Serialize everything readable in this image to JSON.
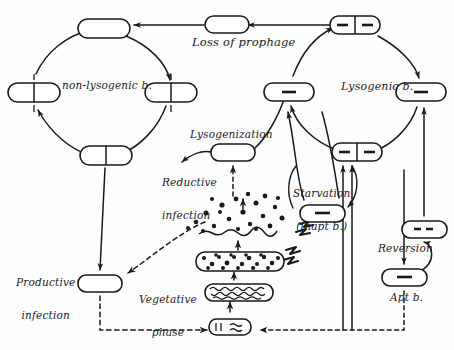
{
  "figure": {
    "ink_color": "#1a1a1a",
    "background_color": "#fefefe",
    "width": 454,
    "height": 350
  },
  "labels": {
    "loss_of_prophage": "Loss of prophage",
    "non_lysogenic": "non-lysogenic b.",
    "lysogenic": "Lysogenic b.",
    "lysogenization": "Lysogenization",
    "reductive_infection_line1": "Reductive",
    "reductive_infection_line2": "infection",
    "productive_infection_line1": "Productive",
    "productive_infection_line2": "infection",
    "vegetative_phase_line1": "Vegetative",
    "vegetative_phase_line2": "phase",
    "starvation_line1": "Starvation",
    "starvation_line2": "(inapt b.)",
    "reversion": "Reversion",
    "apt_bacteria": "Apt b."
  },
  "cycles": [
    {
      "name": "non-lysogenic-cycle",
      "center": [
        108,
        92
      ],
      "radius": 62,
      "cells": [
        {
          "id": "nl-top",
          "pos": [
            108,
            30
          ],
          "type": "empty-cell",
          "prophage_count": 0,
          "dividing": false
        },
        {
          "id": "nl-right",
          "pos": [
            170,
            92
          ],
          "type": "empty-cell-dividing",
          "prophage_count": 0,
          "dividing": true
        },
        {
          "id": "nl-bottom",
          "pos": [
            108,
            155
          ],
          "type": "empty-cell-dividing",
          "prophage_count": 0,
          "dividing": true
        },
        {
          "id": "nl-left",
          "pos": [
            33,
            92
          ],
          "type": "empty-cell-dividing",
          "prophage_count": 0,
          "dividing": true
        }
      ]
    },
    {
      "name": "lysogenic-cycle",
      "center": [
        355,
        92
      ],
      "radius": 62,
      "cells": [
        {
          "id": "ly-top",
          "pos": [
            355,
            25
          ],
          "type": "prophage-cell-dividing",
          "prophage_count": 2,
          "dividing": true
        },
        {
          "id": "ly-right",
          "pos": [
            420,
            92
          ],
          "type": "prophage-cell",
          "prophage_count": 1,
          "dividing": false
        },
        {
          "id": "ly-bottom",
          "pos": [
            357,
            152
          ],
          "type": "prophage-cell-dividing",
          "prophage_count": 2,
          "dividing": true
        },
        {
          "id": "ly-left",
          "pos": [
            288,
            92
          ],
          "type": "prophage-cell",
          "prophage_count": 1,
          "dividing": false
        }
      ]
    }
  ],
  "nodes": [
    {
      "id": "loss-node",
      "pos": [
        225,
        25
      ],
      "type": "empty-cell",
      "prophage_count": 0
    },
    {
      "id": "lysogenization-node",
      "pos": [
        233,
        152
      ],
      "type": "empty-cell",
      "prophage_count": 0
    },
    {
      "id": "productive-node",
      "pos": [
        100,
        283
      ],
      "type": "empty-cell",
      "prophage_count": 0
    },
    {
      "id": "starvation-node",
      "pos": [
        322,
        213
      ],
      "type": "prophage-cell",
      "prophage_count": 1
    },
    {
      "id": "apt-node",
      "pos": [
        404,
        277
      ],
      "type": "prophage-cell",
      "prophage_count": 1
    },
    {
      "id": "reversion-node",
      "pos": [
        424,
        229
      ],
      "type": "prophage-cell",
      "prophage_count": 2
    },
    {
      "id": "burst-lysis",
      "pos": [
        245,
        228
      ],
      "type": "lysed-cell-releasing-phage"
    },
    {
      "id": "packed-phage-cell",
      "pos": [
        240,
        262
      ],
      "type": "cell-full-of-phage-particles"
    },
    {
      "id": "dna-replication-cell",
      "pos": [
        238,
        292
      ],
      "type": "cell-with-replicating-dna"
    },
    {
      "id": "infected-cell",
      "pos": [
        230,
        327
      ],
      "type": "cell-with-adsorbed-phage"
    }
  ],
  "arrows": {
    "solid_count": 16,
    "dashed_count": 6,
    "lightning_bolts": 2,
    "style_note": "hand-drawn ink arrows; dashed arrows mark the productive/lytic route"
  }
}
